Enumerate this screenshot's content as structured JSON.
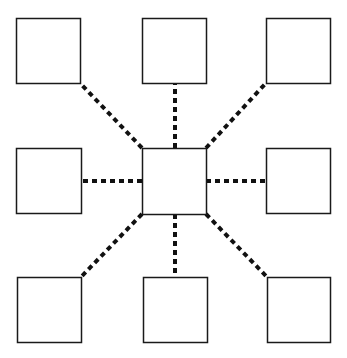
{
  "diagram": {
    "type": "hub-and-spoke",
    "background": "#ffffff",
    "stroke_color": "#1a1a1a",
    "connector_color": "#111111",
    "connector_style": "dotted",
    "nodes": [
      {
        "id": "top-left",
        "x": 16,
        "y": 18,
        "w": 64,
        "h": 65
      },
      {
        "id": "top-center",
        "x": 142,
        "y": 18,
        "w": 64,
        "h": 65
      },
      {
        "id": "top-right",
        "x": 266,
        "y": 18,
        "w": 64,
        "h": 65
      },
      {
        "id": "middle-left",
        "x": 16,
        "y": 148,
        "w": 65,
        "h": 65
      },
      {
        "id": "center",
        "x": 142,
        "y": 148,
        "w": 64,
        "h": 66
      },
      {
        "id": "middle-right",
        "x": 266,
        "y": 148,
        "w": 64,
        "h": 65
      },
      {
        "id": "bottom-left",
        "x": 17,
        "y": 277,
        "w": 64,
        "h": 65
      },
      {
        "id": "bottom-center",
        "x": 143,
        "y": 277,
        "w": 64,
        "h": 65
      },
      {
        "id": "bottom-right",
        "x": 267,
        "y": 277,
        "w": 63,
        "h": 65
      }
    ],
    "edges": [
      {
        "from": "center",
        "to": "top-left",
        "x1": 142,
        "y1": 148,
        "x2": 80,
        "y2": 83
      },
      {
        "from": "center",
        "to": "top-center",
        "x1": 175,
        "y1": 148,
        "x2": 175,
        "y2": 83
      },
      {
        "from": "center",
        "to": "top-right",
        "x1": 206,
        "y1": 148,
        "x2": 266,
        "y2": 83
      },
      {
        "from": "center",
        "to": "middle-left",
        "x1": 142,
        "y1": 181,
        "x2": 81,
        "y2": 181
      },
      {
        "from": "center",
        "to": "middle-right",
        "x1": 206,
        "y1": 181,
        "x2": 266,
        "y2": 181
      },
      {
        "from": "center",
        "to": "bottom-left",
        "x1": 142,
        "y1": 214,
        "x2": 81,
        "y2": 277
      },
      {
        "from": "center",
        "to": "bottom-center",
        "x1": 175,
        "y1": 214,
        "x2": 175,
        "y2": 277
      },
      {
        "from": "center",
        "to": "bottom-right",
        "x1": 206,
        "y1": 214,
        "x2": 267,
        "y2": 277
      }
    ]
  }
}
